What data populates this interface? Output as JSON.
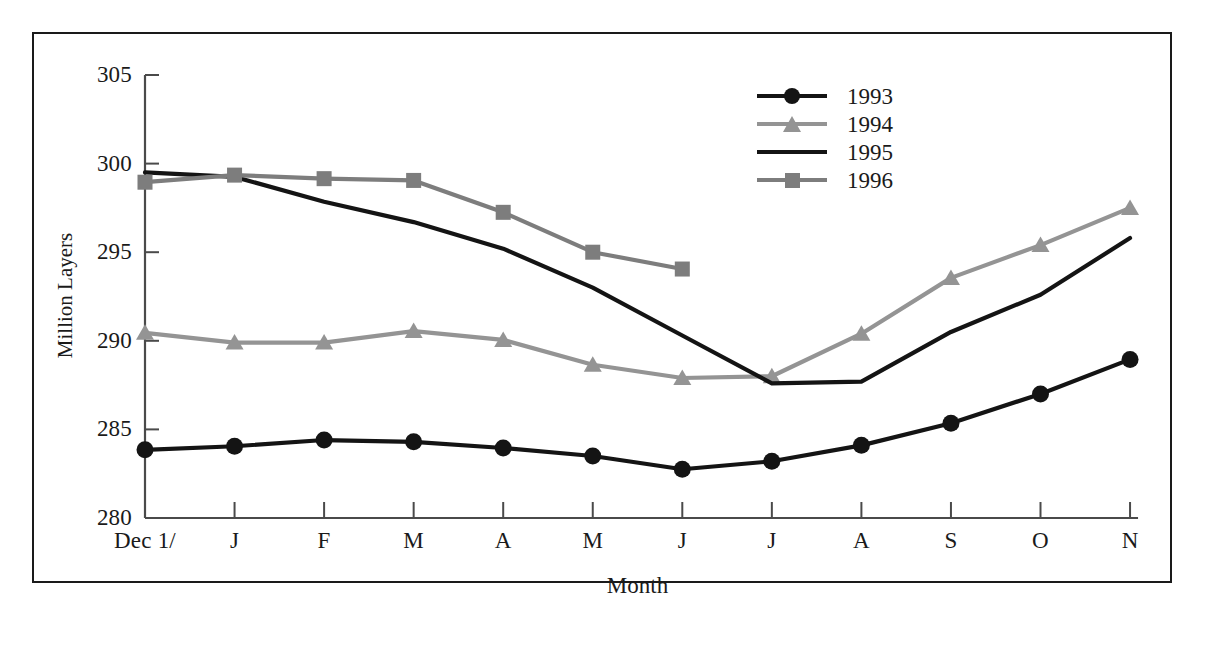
{
  "chart_data": {
    "type": "line",
    "title": "",
    "xlabel": "Month",
    "ylabel": "Million Layers",
    "ylim": [
      280,
      305
    ],
    "yticks": [
      305,
      300,
      295,
      290,
      285,
      280
    ],
    "grid": false,
    "legend_position": "top-right",
    "categories": [
      "Dec 1/",
      "J",
      "F",
      "M",
      "A",
      "M",
      "J",
      "J",
      "A",
      "S",
      "O",
      "N"
    ],
    "series": [
      {
        "name": "1993",
        "color": "#141414",
        "marker": "circle",
        "values": [
          283.85,
          284.05,
          284.4,
          284.3,
          283.95,
          283.5,
          282.75,
          283.2,
          284.1,
          285.35,
          287.0,
          288.95
        ]
      },
      {
        "name": "1994",
        "color": "#949494",
        "marker": "triangle",
        "values": [
          290.45,
          289.9,
          289.9,
          290.55,
          290.05,
          288.65,
          287.9,
          288.0,
          290.4,
          293.55,
          295.4,
          297.5
        ]
      },
      {
        "name": "1995",
        "color": "#141414",
        "marker": "none",
        "values": [
          299.5,
          299.25,
          297.85,
          296.7,
          295.2,
          293.0,
          290.3,
          287.6,
          287.7,
          290.5,
          292.6,
          295.8
        ]
      },
      {
        "name": "1996",
        "color": "#7d7d7d",
        "marker": "square",
        "values": [
          298.95,
          299.35,
          299.15,
          299.05,
          297.25,
          295.0,
          294.05,
          null,
          null,
          null,
          null,
          null
        ]
      }
    ]
  },
  "axis": {
    "y_title": "Million Layers",
    "x_title": "Month",
    "y_tick_labels": [
      "305",
      "300",
      "295",
      "290",
      "285",
      "280"
    ],
    "x_tick_labels": [
      "Dec 1/",
      "J",
      "F",
      "M",
      "A",
      "M",
      "J",
      "J",
      "A",
      "S",
      "O",
      "N"
    ]
  },
  "legend": {
    "entries": [
      {
        "label": "1993",
        "color": "#141414",
        "marker": "circle"
      },
      {
        "label": "1994",
        "color": "#949494",
        "marker": "triangle"
      },
      {
        "label": "1995",
        "color": "#141414",
        "marker": "none"
      },
      {
        "label": "1996",
        "color": "#7d7d7d",
        "marker": "square"
      }
    ]
  },
  "colors": {
    "frame": "#1a1a1a",
    "axis": "#4a4a4a",
    "text": "#1a1a1a",
    "background": "#ffffff"
  }
}
